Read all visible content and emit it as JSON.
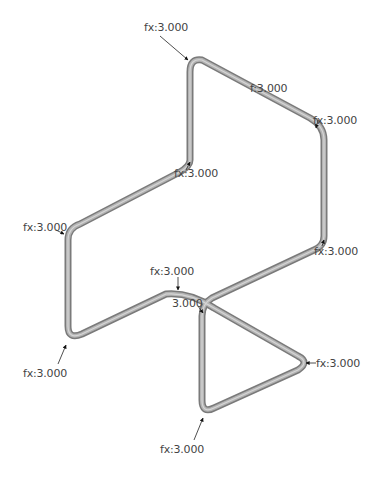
{
  "diagram": {
    "type": "pipe-route-sketch",
    "colors": {
      "pipe": "#9a9a9a",
      "pipe_edge": "#6e6e6e",
      "arrow": "#111111",
      "label": "#444444",
      "background": "#ffffff"
    },
    "pipe_path": [
      [
        190,
        160
      ],
      [
        190,
        68
      ],
      [
        200,
        58
      ],
      [
        318,
        122
      ],
      [
        325,
        135
      ],
      [
        325,
        238
      ],
      [
        318,
        248
      ],
      [
        208,
        300
      ],
      [
        200,
        308
      ],
      [
        200,
        402
      ],
      [
        210,
        410
      ],
      [
        300,
        368
      ],
      [
        300,
        358
      ],
      [
        210,
        305
      ],
      [
        175,
        292
      ],
      [
        160,
        295
      ],
      [
        80,
        335
      ],
      [
        68,
        328
      ],
      [
        68,
        238
      ],
      [
        78,
        226
      ],
      [
        182,
        170
      ],
      [
        190,
        160
      ]
    ],
    "annotations": [
      {
        "id": "top",
        "text": "fx:3.000",
        "x": 144,
        "y": 22,
        "arrow": [
          [
            160,
            36
          ],
          [
            188,
            60
          ]
        ]
      },
      {
        "id": "top-right-upper",
        "text": "f:3.000",
        "x": 250,
        "y": 83,
        "arrow": null
      },
      {
        "id": "top-right",
        "text": "fx:3.000",
        "x": 313,
        "y": 115,
        "arrow": [
          [
            318,
            120
          ],
          [
            316,
            128
          ]
        ]
      },
      {
        "id": "mid-center",
        "text": "fx:3.000",
        "x": 174,
        "y": 168,
        "arrow": [
          [
            186,
            170
          ],
          [
            190,
            162
          ]
        ]
      },
      {
        "id": "left-upper",
        "text": "fx:3.000",
        "x": 23,
        "y": 222,
        "arrow": [
          [
            56,
            230
          ],
          [
            64,
            234
          ]
        ]
      },
      {
        "id": "right-lower",
        "text": "fx:3.000",
        "x": 314,
        "y": 246,
        "arrow": [
          [
            322,
            246
          ],
          [
            324,
            240
          ]
        ]
      },
      {
        "id": "center-top",
        "text": "fx:3.000",
        "x": 150,
        "y": 266,
        "arrow": [
          [
            178,
            277
          ],
          [
            178,
            290
          ]
        ]
      },
      {
        "id": "center-inner",
        "text": "3.000",
        "x": 172,
        "y": 298,
        "arrow": [
          [
            198,
            306
          ],
          [
            203,
            313
          ]
        ]
      },
      {
        "id": "left-lower",
        "text": "fx:3.000",
        "x": 23,
        "y": 368,
        "arrow": [
          [
            58,
            364
          ],
          [
            66,
            345
          ]
        ]
      },
      {
        "id": "triangle-apex",
        "text": "fx:3.000",
        "x": 316,
        "y": 358,
        "arrow": [
          [
            316,
            363
          ],
          [
            306,
            363
          ]
        ]
      },
      {
        "id": "bottom",
        "text": "fx:3.000",
        "x": 160,
        "y": 444,
        "arrow": [
          [
            194,
            440
          ],
          [
            203,
            418
          ]
        ]
      }
    ]
  }
}
